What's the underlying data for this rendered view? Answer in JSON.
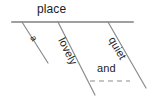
{
  "diagram": {
    "type": "reed-kellogg-sentence-diagram",
    "background_color": "#ffffff",
    "line_color": "#808080",
    "text_color": "#1b1b1b",
    "baseline": {
      "label": "place",
      "x1": 12,
      "y1": 22,
      "x2": 133,
      "y2": 22
    },
    "modifiers": [
      {
        "label": "a",
        "rotation_deg": 61,
        "line": {
          "x1": 22,
          "y1": 22,
          "x2": 48,
          "y2": 63
        }
      },
      {
        "label": "lovely",
        "rotation_deg": 63,
        "line": {
          "x1": 58,
          "y1": 22,
          "x2": 95,
          "y2": 95
        }
      },
      {
        "label": "quiet",
        "rotation_deg": 60,
        "line": {
          "x1": 108,
          "y1": 22,
          "x2": 146,
          "y2": 88
        }
      }
    ],
    "conjunction": {
      "label": "and",
      "dashed_line": {
        "x1": 90,
        "y1": 81,
        "x2": 130,
        "y2": 81
      },
      "dash_pattern": "5 4"
    }
  }
}
